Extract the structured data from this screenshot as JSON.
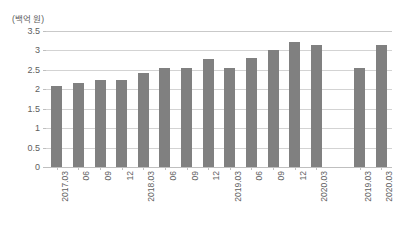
{
  "chart_data": {
    "type": "bar",
    "title": "",
    "subtitle": "",
    "unit_label": "(백억 원)",
    "xlabel": "",
    "ylabel": "",
    "ylim": [
      0,
      3.5
    ],
    "yticks": [
      "0",
      "0.5",
      "1",
      "1.5",
      "2",
      "2.5",
      "3",
      "3.5"
    ],
    "ytick_values": [
      0,
      0.5,
      1,
      1.5,
      2,
      2.5,
      3,
      3.5
    ],
    "grid": true,
    "legend": "none",
    "bar_color": "#808080",
    "gridline_color": "#d3d3d3",
    "categories": [
      "2017.03",
      "06",
      "09",
      "12",
      "2018.03",
      "06",
      "09",
      "12",
      "2019.03",
      "06",
      "09",
      "12",
      "2020.03",
      "2019.03",
      "2020.03"
    ],
    "values": [
      2.08,
      2.17,
      2.24,
      2.24,
      2.41,
      2.56,
      2.56,
      2.78,
      2.56,
      2.8,
      3.02,
      3.22,
      3.14,
      2.54,
      3.14
    ],
    "group_gap_after_index": 12,
    "annotations": []
  }
}
